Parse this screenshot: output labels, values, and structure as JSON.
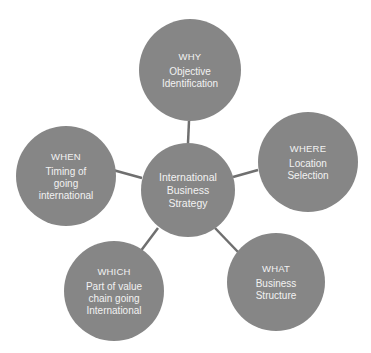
{
  "diagram": {
    "title": "International Business Strategy",
    "colors": {
      "node_fill": "#868686",
      "text": "#f2f2f2",
      "connector": "#6f6f6f",
      "background": "#ffffff"
    },
    "hub": {
      "label": "International Business Strategy",
      "lines": [
        "International",
        "Business",
        "Strategy"
      ]
    },
    "nodes": [
      {
        "id": "why",
        "question": "WHY",
        "description": "Objective Identification"
      },
      {
        "id": "where",
        "question": "WHERE",
        "description": "Location Selection"
      },
      {
        "id": "what",
        "question": "WHAT",
        "description": "Business Structure"
      },
      {
        "id": "which",
        "question": "WHICH",
        "description": "Part of value chain going International"
      },
      {
        "id": "when",
        "question": "WHEN",
        "description": "Timing of going international"
      }
    ],
    "edges": [
      [
        "hub",
        "why"
      ],
      [
        "hub",
        "where"
      ],
      [
        "hub",
        "what"
      ],
      [
        "hub",
        "which"
      ],
      [
        "hub",
        "when"
      ]
    ]
  }
}
